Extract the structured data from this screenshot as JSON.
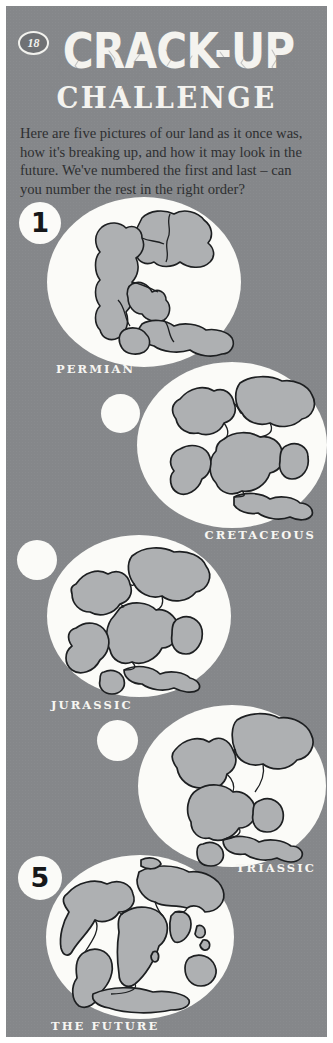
{
  "page": {
    "number": "18",
    "background_color": "#85878a",
    "ink_color": "#f4f3ef",
    "land_color": "#aeb0b2",
    "globe_color": "#fbfbf8"
  },
  "header": {
    "title_line1": "CRACK-UP",
    "title_line2": "CHALLENGE",
    "intro": "Here are five pictures of our land as it once was, how it's breaking up, and how it may look in the future. We've numbered the first and last – can you number the rest in the right order?"
  },
  "puzzle": {
    "items": [
      {
        "id": "permian",
        "label": "PERMIAN",
        "answer": "1",
        "answered": true,
        "label_align": "left"
      },
      {
        "id": "cretaceous",
        "label": "CRETACEOUS",
        "answer": "",
        "answered": false,
        "label_align": "right"
      },
      {
        "id": "jurassic",
        "label": "JURASSIC",
        "answer": "",
        "answered": false,
        "label_align": "left"
      },
      {
        "id": "triassic",
        "label": "TRIASSIC",
        "answer": "",
        "answered": false,
        "label_align": "right"
      },
      {
        "id": "future",
        "label": "THE FUTURE",
        "answer": "5",
        "answered": true,
        "label_align": "left"
      }
    ]
  }
}
